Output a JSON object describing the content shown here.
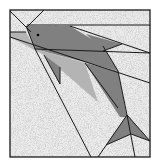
{
  "figure": {
    "colors": {
      "background": "#e6e6e6",
      "dark": "#808080",
      "light": "#b4b4b4",
      "line": "#1a1a1a",
      "eye": "#000000"
    }
  }
}
